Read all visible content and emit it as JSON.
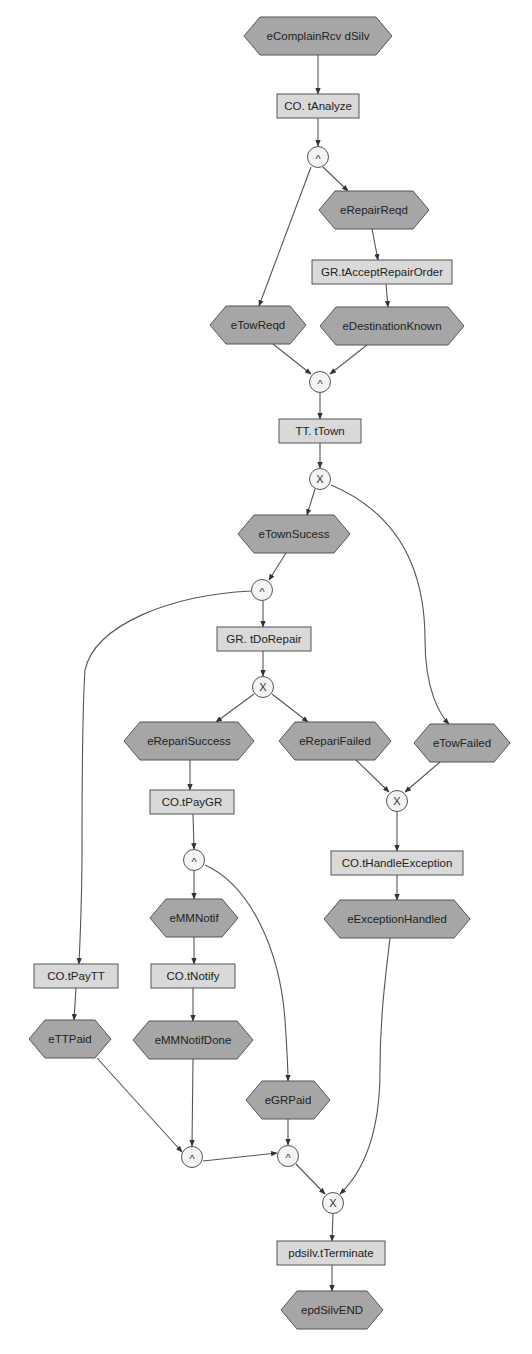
{
  "diagram": {
    "colors": {
      "event_fill": "#a6a6a6",
      "task_fill": "#d9d9d9",
      "gate_fill": "#f4f4f4",
      "stroke": "#555555",
      "background": "#ffffff"
    },
    "events": [
      {
        "id": "eComplainRcvdSilv",
        "label": "eComplainRcv dSilv",
        "x": 318,
        "y": 36,
        "w": 148
      },
      {
        "id": "eRepairReqd",
        "label": "eRepairReqd",
        "x": 374,
        "y": 210,
        "w": 110
      },
      {
        "id": "eTowReqd",
        "label": "eTowReqd",
        "x": 258,
        "y": 325,
        "w": 96
      },
      {
        "id": "eDestinationKnown",
        "label": "eDestinationKnown",
        "x": 392,
        "y": 326,
        "w": 144
      },
      {
        "id": "eTownSucess",
        "label": "eTownSucess",
        "x": 294,
        "y": 534,
        "w": 112
      },
      {
        "id": "eRepariSuccess",
        "label": "eRepariSuccess",
        "x": 189,
        "y": 741,
        "w": 130
      },
      {
        "id": "eRepariFailed",
        "label": "eRepariFailed",
        "x": 335,
        "y": 741,
        "w": 112
      },
      {
        "id": "eTowFailed",
        "label": "eTowFailed",
        "x": 462,
        "y": 743,
        "w": 96
      },
      {
        "id": "eMMNotif",
        "label": "eMMNotif",
        "x": 194,
        "y": 918,
        "w": 88
      },
      {
        "id": "eExceptionHandled",
        "label": "eExceptionHandled",
        "x": 397,
        "y": 919,
        "w": 146
      },
      {
        "id": "eTTPaid",
        "label": "eTTPaid",
        "x": 70,
        "y": 1039,
        "w": 82
      },
      {
        "id": "eMMNotifDone",
        "label": "eMMNotifDone",
        "x": 193,
        "y": 1040,
        "w": 120
      },
      {
        "id": "eGRPaid",
        "label": "eGRPaid",
        "x": 288,
        "y": 1100,
        "w": 84
      },
      {
        "id": "epdSilvEND",
        "label": "epdSilvEND",
        "x": 332,
        "y": 1310,
        "w": 102
      }
    ],
    "tasks": [
      {
        "id": "CO.tAnalyze",
        "label": "CO. tAnalyze",
        "x": 318,
        "y": 106,
        "w": 82
      },
      {
        "id": "GR.tAcceptRepairOrder",
        "label": "GR.tAcceptRepairOrder",
        "x": 382,
        "y": 272,
        "w": 140
      },
      {
        "id": "TT.tTown",
        "label": "TT. tTown",
        "x": 320,
        "y": 431,
        "w": 82
      },
      {
        "id": "GR.tDoRepair",
        "label": "GR. tDoRepair",
        "x": 264,
        "y": 639,
        "w": 94
      },
      {
        "id": "CO.tPayGR",
        "label": "CO.tPayGR",
        "x": 192,
        "y": 802,
        "w": 84
      },
      {
        "id": "CO.tHandleException",
        "label": "CO.tHandleException",
        "x": 397,
        "y": 863,
        "w": 132
      },
      {
        "id": "CO.tPayTT",
        "label": "CO.tPayTT",
        "x": 76,
        "y": 976,
        "w": 84
      },
      {
        "id": "CO.tNotify",
        "label": "CO.tNotify",
        "x": 193,
        "y": 976,
        "w": 84
      },
      {
        "id": "pdsilv.tTerminate",
        "label": "pdsilv.tTerminate",
        "x": 331,
        "y": 1253,
        "w": 108
      }
    ],
    "gateways": [
      {
        "id": "g_and_1",
        "symbol": "^",
        "x": 318,
        "y": 157
      },
      {
        "id": "g_and_2",
        "symbol": "^",
        "x": 320,
        "y": 382
      },
      {
        "id": "g_xor_1",
        "symbol": "X",
        "x": 320,
        "y": 479
      },
      {
        "id": "g_and_3",
        "symbol": "^",
        "x": 262,
        "y": 590
      },
      {
        "id": "g_xor_2",
        "symbol": "X",
        "x": 263,
        "y": 687
      },
      {
        "id": "g_xor_3",
        "symbol": "X",
        "x": 397,
        "y": 801
      },
      {
        "id": "g_and_4",
        "symbol": "^",
        "x": 194,
        "y": 860
      },
      {
        "id": "g_and_5",
        "symbol": "^",
        "x": 192,
        "y": 1157
      },
      {
        "id": "g_and_6",
        "symbol": "^",
        "x": 288,
        "y": 1156
      },
      {
        "id": "g_xor_4",
        "symbol": "X",
        "x": 333,
        "y": 1203
      }
    ],
    "edges": [
      {
        "from": "eComplainRcvdSilv",
        "to": "CO.tAnalyze",
        "d": "M318,55 L318,94"
      },
      {
        "from": "CO.tAnalyze",
        "to": "g_and_1",
        "d": "M318,118 L318,146"
      },
      {
        "from": "g_and_1",
        "to": "eRepairReqd",
        "d": "M323,167 L348,191"
      },
      {
        "from": "eRepairReqd",
        "to": "GR.tAcceptRepairOrder",
        "d": "M372,229 L378,260"
      },
      {
        "from": "GR.tAcceptRepairOrder",
        "to": "eDestinationKnown",
        "d": "M386,284 L388,307"
      },
      {
        "from": "g_and_1",
        "to": "eTowReqd",
        "d": "M311,167 L259,306"
      },
      {
        "from": "eTowReqd",
        "to": "g_and_2",
        "d": "M273,344 L311,374"
      },
      {
        "from": "eDestinationKnown",
        "to": "g_and_2",
        "d": "M367,345 L330,374"
      },
      {
        "from": "g_and_2",
        "to": "TT.tTown",
        "d": "M320,393 L320,419"
      },
      {
        "from": "TT.tTown",
        "to": "g_xor_1",
        "d": "M320,443 L320,468"
      },
      {
        "from": "g_xor_1",
        "to": "eTownSucess",
        "d": "M315,489 L307,515"
      },
      {
        "from": "g_xor_1",
        "to": "eTowFailed",
        "d": "M331,485 C390,510 425,560 425,640 C425,690 440,715 449,724"
      },
      {
        "from": "eTownSucess",
        "to": "g_and_3",
        "d": "M286,553 L269,580"
      },
      {
        "from": "g_and_3",
        "to": "GR.tDoRepair",
        "d": "M263,601 L263,627"
      },
      {
        "from": "g_and_3",
        "to": "CO.tPayTT",
        "d": "M251,591 C170,595 95,625 85,670 C83,700 82,760 82,850 C82,900 80,940 79,964"
      },
      {
        "from": "GR.tDoRepair",
        "to": "g_xor_2",
        "d": "M263,651 L263,676"
      },
      {
        "from": "g_xor_2",
        "to": "eRepariSuccess",
        "d": "M254,694 L216,722"
      },
      {
        "from": "g_xor_2",
        "to": "eRepariFailed",
        "d": "M272,694 L308,722"
      },
      {
        "from": "eRepariFailed",
        "to": "g_xor_3",
        "d": "M356,760 L389,792"
      },
      {
        "from": "eTowFailed",
        "to": "g_xor_3",
        "d": "M440,762 L405,792"
      },
      {
        "from": "g_xor_3",
        "to": "CO.tHandleException",
        "d": "M397,812 L397,851"
      },
      {
        "from": "CO.tHandleException",
        "to": "eExceptionHandled",
        "d": "M397,875 L397,900"
      },
      {
        "from": "eExceptionHandled",
        "to": "g_xor_4",
        "d": "M390,938 C385,980 380,1020 380,1070 C380,1130 365,1170 340,1194"
      },
      {
        "from": "eRepariSuccess",
        "to": "CO.tPayGR",
        "d": "M190,760 L190,790"
      },
      {
        "from": "CO.tPayGR",
        "to": "g_and_4",
        "d": "M193,814 L194,849"
      },
      {
        "from": "g_and_4",
        "to": "eMMNotif",
        "d": "M194,871 L194,899"
      },
      {
        "from": "g_and_4",
        "to": "eGRPaid",
        "d": "M205,865 C250,885 280,950 285,1020 C287,1050 288,1070 288,1081"
      },
      {
        "from": "eMMNotif",
        "to": "CO.tNotify",
        "d": "M194,937 L194,964"
      },
      {
        "from": "CO.tNotify",
        "to": "eMMNotifDone",
        "d": "M193,988 L193,1021"
      },
      {
        "from": "CO.tPayTT",
        "to": "eTTPaid",
        "d": "M76,988 L74,1020"
      },
      {
        "from": "eTTPaid",
        "to": "g_and_5",
        "d": "M97,1058 L182,1152"
      },
      {
        "from": "eMMNotifDone",
        "to": "g_and_5",
        "d": "M193,1059 L192,1146"
      },
      {
        "from": "g_and_5",
        "to": "g_and_6",
        "d": "M203,1161 L277,1153"
      },
      {
        "from": "eGRPaid",
        "to": "g_and_6",
        "d": "M288,1119 L288,1145"
      },
      {
        "from": "g_and_6",
        "to": "g_xor_4",
        "d": "M296,1164 L325,1194"
      },
      {
        "from": "g_xor_4",
        "to": "pdsilv.tTerminate",
        "d": "M333,1214 L332,1241"
      },
      {
        "from": "pdsilv.tTerminate",
        "to": "epdSilvEND",
        "d": "M332,1265 L332,1291"
      }
    ]
  }
}
